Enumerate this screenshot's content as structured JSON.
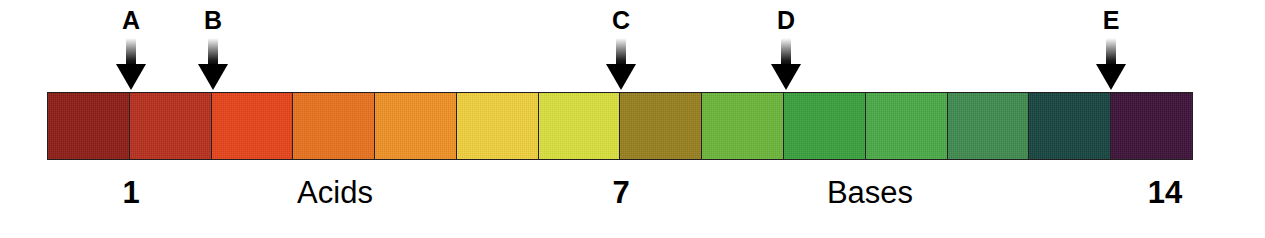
{
  "diagram": {
    "background_color": "#ffffff"
  },
  "chart_data": {
    "type": "bar",
    "xlabel": "pH",
    "ylabel": "",
    "categories": [
      "1",
      "2",
      "3",
      "4",
      "5",
      "6",
      "7",
      "8",
      "9",
      "10",
      "11",
      "12",
      "13",
      "14"
    ],
    "values": [
      1,
      1,
      1,
      1,
      1,
      1,
      1,
      1,
      1,
      1,
      1,
      1,
      1,
      1
    ],
    "grid": false,
    "legend": "none",
    "colors": [
      "#8d1e16",
      "#b8301e",
      "#e6441a",
      "#e8721e",
      "#ef9226",
      "#f0d03e",
      "#d9e03d",
      "#98801f",
      "#6cb63a",
      "#3aa03e",
      "#4aaa46",
      "#3f8b4f",
      "#174540",
      "#3c1239"
    ],
    "annotations": [
      {
        "label": "A",
        "ph": 2,
        "position_pct": 7.2
      },
      {
        "label": "B",
        "ph": 3,
        "position_pct": 14.4
      },
      {
        "label": "C",
        "ph": 8,
        "position_pct": 50.0
      },
      {
        "label": "D",
        "ph": 10,
        "position_pct": 64.4
      },
      {
        "label": "E",
        "ph": 14,
        "position_pct": 92.8
      }
    ]
  },
  "bar": {
    "segments": [
      {
        "ph": "1",
        "color": "#8d1e16",
        "name": "very-strong-acid"
      },
      {
        "ph": "2",
        "color": "#b8301e",
        "name": "strong-acid"
      },
      {
        "ph": "3",
        "color": "#e6441a",
        "name": "acid"
      },
      {
        "ph": "4",
        "color": "#e8721e",
        "name": "acid"
      },
      {
        "ph": "5",
        "color": "#ef9226",
        "name": "weak-acid"
      },
      {
        "ph": "6",
        "color": "#f0d03e",
        "name": "weak-acid"
      },
      {
        "ph": "7",
        "color": "#d9e03d",
        "name": "neutral"
      },
      {
        "ph": "8",
        "color": "#98801f",
        "name": "weak-base"
      },
      {
        "ph": "9",
        "color": "#6cb63a",
        "name": "weak-base"
      },
      {
        "ph": "10",
        "color": "#3aa03e",
        "name": "base"
      },
      {
        "ph": "11",
        "color": "#4aaa46",
        "name": "base"
      },
      {
        "ph": "12",
        "color": "#3f8b4f",
        "name": "strong-base"
      },
      {
        "ph": "13",
        "color": "#174540",
        "name": "strong-base"
      },
      {
        "ph": "14",
        "color": "#3c1239",
        "name": "very-strong-base"
      }
    ],
    "border_color": "#231f20"
  },
  "arrows": [
    {
      "label": "A",
      "x": 131
    },
    {
      "label": "B",
      "x": 213
    },
    {
      "label": "C",
      "x": 621
    },
    {
      "label": "D",
      "x": 786
    },
    {
      "label": "E",
      "x": 1111
    }
  ],
  "scale_labels": [
    {
      "text": "1",
      "x": 131,
      "type": "number"
    },
    {
      "text": "Acids",
      "x": 335,
      "type": "word"
    },
    {
      "text": "7",
      "x": 621,
      "type": "number"
    },
    {
      "text": "Bases",
      "x": 870,
      "type": "word"
    },
    {
      "text": "14",
      "x": 1165,
      "type": "number"
    }
  ]
}
